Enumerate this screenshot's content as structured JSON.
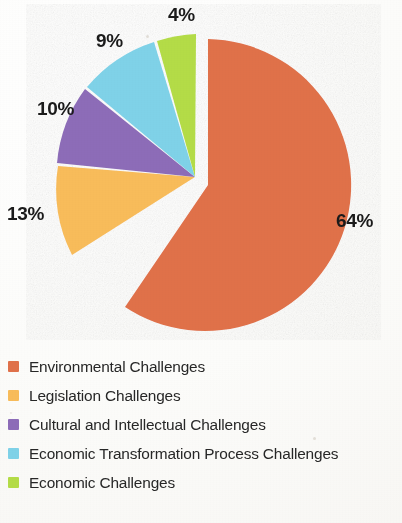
{
  "chart_data": {
    "type": "pie",
    "title": "",
    "subtitle": "",
    "xlabel": "",
    "ylabel": "",
    "legend_position": "bottom-left",
    "grid": false,
    "exploded_slice": "Environmental Challenges",
    "units": "percent",
    "categories": [
      "Environmental Challenges",
      "Legislation Challenges",
      "Cultural and Intellectual Challenges",
      "Economic Transformation Process Challenges",
      "Economic Challenges"
    ],
    "values": [
      64,
      13,
      10,
      9,
      4
    ],
    "data_labels": [
      "64%",
      "13%",
      "10%",
      "9%",
      "4%"
    ],
    "colors": [
      "#E0714A",
      "#F8BC5A",
      "#8D6CB8",
      "#7FD2E8",
      "#B4DC47"
    ],
    "slices": [
      {
        "label": "Environmental Challenges",
        "value": 64,
        "display": "64%",
        "color": "#E0714A",
        "exploded": true
      },
      {
        "label": "Legislation Challenges",
        "value": 13,
        "display": "13%",
        "color": "#F8BC5A",
        "exploded": false
      },
      {
        "label": "Cultural and Intellectual Challenges",
        "value": 10,
        "display": "10%",
        "color": "#8D6CB8",
        "exploded": false
      },
      {
        "label": "Economic Transformation Process Challenges",
        "value": 9,
        "display": "9%",
        "color": "#7FD2E8",
        "exploded": false
      },
      {
        "label": "Economic Challenges",
        "value": 4,
        "display": "4%",
        "color": "#B4DC47",
        "exploded": false
      }
    ]
  },
  "labels": {
    "pct_64": "64%",
    "pct_13": "13%",
    "pct_10": "10%",
    "pct_9": "9%",
    "pct_4": "4%"
  },
  "legend": {
    "items": [
      {
        "label": "Environmental Challenges",
        "color": "#E0714A"
      },
      {
        "label": "Legislation Challenges",
        "color": "#F8BC5A"
      },
      {
        "label": "Cultural and Intellectual Challenges",
        "color": "#8D6CB8"
      },
      {
        "label": "Economic Transformation Process Challenges",
        "color": "#7FD2E8"
      },
      {
        "label": "Economic Challenges",
        "color": "#B4DC47"
      }
    ]
  }
}
